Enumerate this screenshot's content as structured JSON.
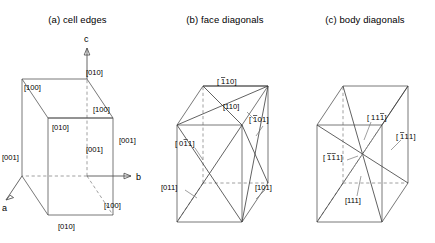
{
  "figure": {
    "caption_style": "crystallographic direction indices on an orthorhombic unit cell",
    "panels": [
      {
        "id": "a",
        "title": "(a)  cell edges",
        "axes": [
          {
            "name": "a-axis-label",
            "text": "a"
          },
          {
            "name": "b-axis-label",
            "text": "b"
          },
          {
            "name": "c-axis-label",
            "text": "c"
          }
        ],
        "labels": [
          {
            "text": "[010]",
            "x": 86,
            "y": 75
          },
          {
            "text": "[100]",
            "x": 30,
            "y": 90
          },
          {
            "text": "[100]",
            "x": 97,
            "y": 112
          },
          {
            "text": "[010]",
            "x": 47,
            "y": 128
          },
          {
            "text": "[001]",
            "x": 128,
            "y": 140
          },
          {
            "text": "[001]",
            "x": 88,
            "y": 150
          },
          {
            "text": "[001]",
            "x": 3,
            "y": 158
          },
          {
            "text": "[100]",
            "x": 104,
            "y": 206
          },
          {
            "text": "[010]",
            "x": 55,
            "y": 227
          }
        ]
      },
      {
        "id": "b",
        "title": "(b)  face diagonals",
        "labels": [
          {
            "text": "[Đ1Đ1 0]",
            "render": "bar1-1-0-top",
            "x": 77,
            "y": 82
          },
          {
            "text": "[110]",
            "x": 80,
            "y": 107
          },
          {
            "text": "[Đ1 01]",
            "render": "bar1-0-1-right",
            "x": 104,
            "y": 120
          },
          {
            "text": "[0Đ1 1]",
            "render": "0-bar1-1",
            "x": 28,
            "y": 139
          },
          {
            "text": "[011]",
            "x": 14,
            "y": 180
          },
          {
            "text": "[101]",
            "x": 105,
            "y": 180
          }
        ]
      },
      {
        "id": "c",
        "title": "(c)  body diagonals",
        "labels": [
          {
            "text": "[11Đ1]",
            "render": "1-1-bar1",
            "x": 80,
            "y": 116
          },
          {
            "text": "[Đ1 11]",
            "render": "bar1-1-1",
            "x": 112,
            "y": 134
          },
          {
            "text": "[Đ1Đ1 1]",
            "render": "bar1-bar1-1",
            "x": 40,
            "y": 157
          },
          {
            "text": "[111]",
            "x": 62,
            "y": 205
          }
        ]
      }
    ]
  },
  "indices": {
    "cell_edges": {
      "top_back_right": "[010]",
      "top_back_left": "[100]",
      "top_front_right": "[100]",
      "top_front_left": "[010]",
      "right_vertical": "[001]",
      "middle_vertical": "[001]",
      "left_vertical": "[001]",
      "bottom_right": "[100]",
      "bottom_front": "[010]"
    },
    "face_diagonals": {
      "top_upper": "[-110]",
      "top_lower": "[110]",
      "right_upper": "[-101]",
      "left_upper": "[0-11]",
      "left_lower": "[011]",
      "right_lower": "[101]"
    },
    "body_diagonals": {
      "upper_left_to_lower_right": "[11-1]",
      "upper_right_to_lower_left": "[-111]",
      "left_mid": "[-1-11]",
      "bottom": "[111]"
    }
  },
  "colors": {
    "background": "#ffffff",
    "solid_edge": "#555555",
    "hidden_edge": "#888888",
    "diagonal": "#3a3a3a",
    "text": "#000000"
  }
}
